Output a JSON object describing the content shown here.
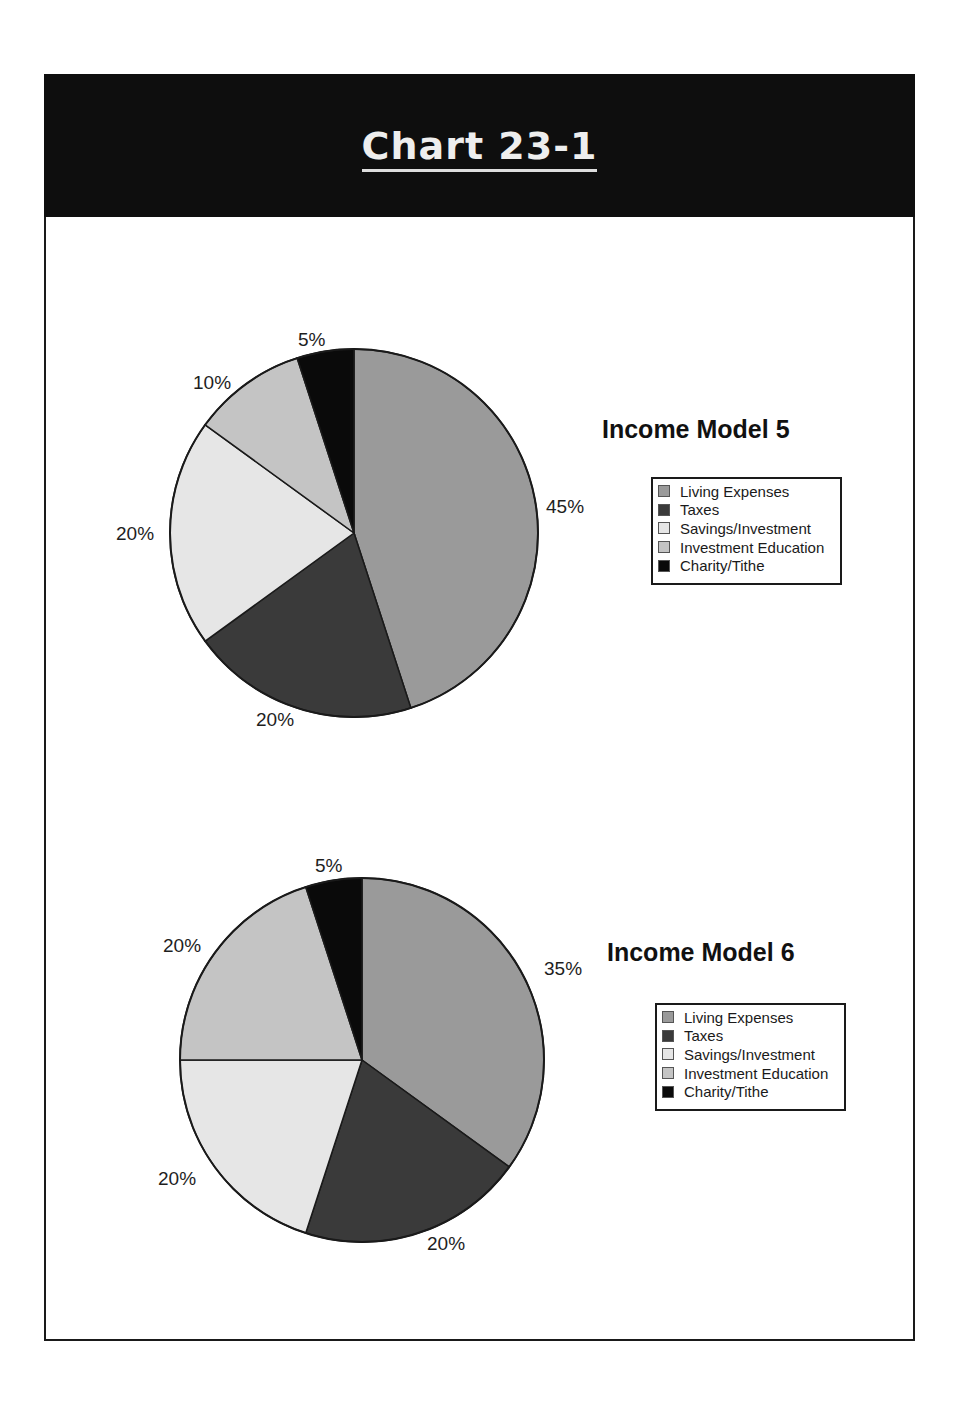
{
  "header": {
    "title": "Chart 23-1"
  },
  "colors": {
    "living_expenses": "#9a9a9a",
    "taxes": "#3a3a3a",
    "savings_investment": "#e6e6e6",
    "investment_education": "#c4c4c4",
    "charity_tithe": "#0a0a0a",
    "header_bg": "#0e0e0e"
  },
  "charts": [
    {
      "title": "Income Model 5",
      "legend": [
        "Living Expenses",
        "Taxes",
        "Savings/Investment",
        "Investment Education",
        "Charity/Tithe"
      ],
      "labels": {
        "living": "45%",
        "taxes": "20%",
        "savings": "20%",
        "education": "10%",
        "charity": "5%"
      }
    },
    {
      "title": "Income Model 6",
      "legend": [
        "Living Expenses",
        "Taxes",
        "Savings/Investment",
        "Investment Education",
        "Charity/Tithe"
      ],
      "labels": {
        "living": "35%",
        "taxes": "20%",
        "savings": "20%",
        "education": "20%",
        "charity": "5%"
      }
    }
  ],
  "chart_data": [
    {
      "type": "pie",
      "title": "Income Model 5",
      "categories": [
        "Living Expenses",
        "Taxes",
        "Savings/Investment",
        "Investment Education",
        "Charity/Tithe"
      ],
      "values": [
        45,
        20,
        20,
        10,
        5
      ],
      "unit": "%",
      "start_angle": "12 o'clock",
      "direction": "clockwise",
      "legend_position": "right"
    },
    {
      "type": "pie",
      "title": "Income Model 6",
      "categories": [
        "Living Expenses",
        "Taxes",
        "Savings/Investment",
        "Investment Education",
        "Charity/Tithe"
      ],
      "values": [
        35,
        20,
        20,
        20,
        5
      ],
      "unit": "%",
      "start_angle": "12 o'clock",
      "direction": "clockwise",
      "legend_position": "right"
    }
  ]
}
